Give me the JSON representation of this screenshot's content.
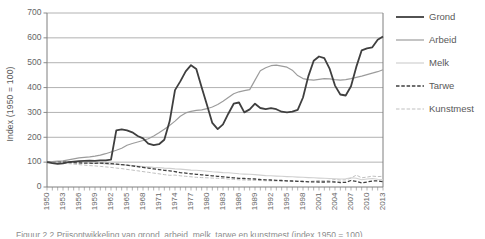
{
  "figure": {
    "caption_clipped": "Figuur 2.2 Prijsontwikkeling van grond, arbeid, melk, tarwe en kunstmest (index 1950 = 100)"
  },
  "colors": {
    "grid": "#9e9e9e",
    "axis": "#7f7f7f",
    "tick_text": "#666666",
    "legend_text": "#595959"
  },
  "chart_data": {
    "type": "line",
    "title": "",
    "xlabel": "",
    "ylabel": "Index (1950 = 100)",
    "ylim": [
      0,
      700
    ],
    "yticks": [
      0,
      100,
      200,
      300,
      400,
      500,
      600,
      700
    ],
    "grid": "horizontal",
    "legend_position": "right",
    "x": [
      1950,
      1951,
      1952,
      1953,
      1954,
      1955,
      1956,
      1957,
      1958,
      1959,
      1960,
      1961,
      1962,
      1963,
      1964,
      1965,
      1966,
      1967,
      1968,
      1969,
      1970,
      1971,
      1972,
      1973,
      1974,
      1975,
      1976,
      1977,
      1978,
      1979,
      1980,
      1981,
      1982,
      1983,
      1984,
      1985,
      1986,
      1987,
      1988,
      1989,
      1990,
      1991,
      1992,
      1993,
      1994,
      1995,
      1996,
      1997,
      1998,
      1999,
      2000,
      2001,
      2002,
      2003,
      2004,
      2005,
      2006,
      2007,
      2008,
      2009,
      2010,
      2011,
      2012,
      2013
    ],
    "x_tick_labels": [
      "1950",
      "1953",
      "1956",
      "1959",
      "1962",
      "1965",
      "1968",
      "1971",
      "1974",
      "1977",
      "1980",
      "1983",
      "1986",
      "1989",
      "1992",
      "1995",
      "1998",
      "2001",
      "2004",
      "2007",
      "2010",
      "2013"
    ],
    "series": [
      {
        "name": "Grond",
        "color": "#3f3f3f",
        "width": 1.8,
        "dash": "",
        "values": [
          100,
          96,
          93,
          95,
          100,
          102,
          104,
          105,
          106,
          105,
          107,
          107,
          110,
          228,
          232,
          228,
          220,
          205,
          196,
          174,
          168,
          172,
          190,
          265,
          390,
          425,
          465,
          490,
          475,
          400,
          330,
          258,
          233,
          252,
          295,
          335,
          340,
          300,
          312,
          335,
          318,
          313,
          317,
          313,
          303,
          300,
          303,
          310,
          360,
          445,
          508,
          525,
          518,
          475,
          408,
          372,
          368,
          405,
          483,
          550,
          558,
          562,
          592,
          605
        ]
      },
      {
        "name": "Arbeid",
        "color": "#9c9c9c",
        "width": 1.2,
        "dash": "",
        "values": [
          100,
          102,
          104,
          105,
          109,
          113,
          117,
          119,
          121,
          124,
          128,
          134,
          141,
          148,
          156,
          168,
          175,
          181,
          187,
          194,
          205,
          218,
          232,
          248,
          265,
          285,
          298,
          304,
          308,
          310,
          315,
          322,
          332,
          345,
          360,
          375,
          383,
          388,
          392,
          430,
          468,
          480,
          488,
          490,
          486,
          482,
          470,
          448,
          436,
          432,
          430,
          433,
          436,
          435,
          432,
          430,
          432,
          436,
          441,
          446,
          452,
          458,
          464,
          472
        ]
      },
      {
        "name": "Melk",
        "color": "#d0d0d0",
        "width": 1.1,
        "dash": "",
        "values": [
          100,
          99,
          99,
          100,
          100,
          99,
          98,
          98,
          96,
          95,
          95,
          93,
          92,
          91,
          90,
          88,
          86,
          84,
          82,
          81,
          79,
          78,
          76,
          75,
          73,
          72,
          70,
          68,
          67,
          65,
          63,
          61,
          60,
          58,
          57,
          55,
          53,
          52,
          51,
          50,
          48,
          46,
          45,
          44,
          43,
          42,
          41,
          40,
          39,
          38,
          37,
          36,
          35,
          34,
          33,
          32,
          33,
          37,
          35,
          29,
          32,
          34,
          31,
          30
        ]
      },
      {
        "name": "Tarwe",
        "color": "#3f3f3f",
        "width": 1.3,
        "dash": "3.5,1.8",
        "values": [
          100,
          101,
          102,
          101,
          99,
          98,
          97,
          96,
          96,
          95,
          96,
          95,
          94,
          92,
          90,
          88,
          85,
          82,
          79,
          76,
          73,
          70,
          67,
          65,
          62,
          58,
          56,
          53,
          51,
          49,
          47,
          45,
          43,
          41,
          39,
          37,
          35,
          34,
          33,
          32,
          30,
          29,
          28,
          27,
          26,
          25,
          24,
          23,
          22,
          21,
          21,
          20,
          20,
          21,
          20,
          18,
          19,
          26,
          23,
          17,
          20,
          24,
          25,
          21
        ]
      },
      {
        "name": "Kunstmest",
        "color": "#bfbfbf",
        "width": 1.0,
        "dash": "3.5,1.8",
        "values": [
          100,
          99,
          97,
          96,
          94,
          92,
          90,
          88,
          86,
          85,
          83,
          81,
          79,
          76,
          74,
          71,
          68,
          65,
          62,
          59,
          56,
          53,
          50,
          47,
          48,
          45,
          43,
          41,
          39,
          38,
          37,
          36,
          35,
          34,
          32,
          31,
          29,
          28,
          27,
          27,
          26,
          25,
          25,
          24,
          24,
          23,
          23,
          24,
          23,
          22,
          24,
          26,
          25,
          27,
          30,
          28,
          29,
          36,
          48,
          37,
          40,
          44,
          42,
          43
        ]
      }
    ]
  }
}
